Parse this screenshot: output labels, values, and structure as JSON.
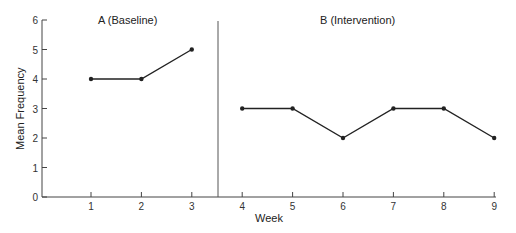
{
  "chart_data": {
    "type": "line",
    "title": "",
    "xlabel": "Week",
    "ylabel": "Mean Frequency",
    "ylim": [
      0,
      6
    ],
    "yticks": [
      0,
      1,
      2,
      3,
      4,
      5,
      6
    ],
    "xticks": [
      1,
      2,
      3,
      4,
      5,
      6,
      7,
      8,
      9
    ],
    "grid": false,
    "phase_line_between": [
      3,
      4
    ],
    "series": [
      {
        "name": "A (Baseline)",
        "x": [
          1,
          2,
          3
        ],
        "values": [
          4,
          4,
          5
        ]
      },
      {
        "name": "B (Intervention)",
        "x": [
          4,
          5,
          6,
          7,
          8,
          9
        ],
        "values": [
          3,
          3,
          2,
          3,
          3,
          2
        ]
      }
    ],
    "annotations": [
      "A (Baseline)",
      "B (Intervention)"
    ]
  },
  "labels": {
    "phase_a": "A (Baseline)",
    "phase_b": "B (Intervention)",
    "x_axis": "Week",
    "y_axis": "Mean Frequency"
  },
  "colors": {
    "line": "#222222",
    "axis": "#444444"
  }
}
